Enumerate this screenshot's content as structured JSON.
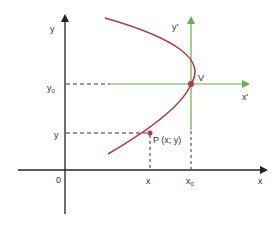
{
  "diagram": {
    "colors": {
      "axis": "#222222",
      "curve": "#b03a48",
      "shifted_axis": "#6aae4a",
      "dash": "#333333",
      "point": "#b03a48"
    },
    "main_axes": {
      "x_label": "x",
      "y_label": "y",
      "origin_label": "0"
    },
    "shifted_axes": {
      "x_label": "x'",
      "y_label": "y'"
    },
    "vertex": {
      "label": "V",
      "x_label": "x",
      "x_sub": "0",
      "y_label": "y",
      "y_sub": "0"
    },
    "point": {
      "label": "P (x; y)",
      "x_label": "x",
      "y_label": "y"
    }
  }
}
